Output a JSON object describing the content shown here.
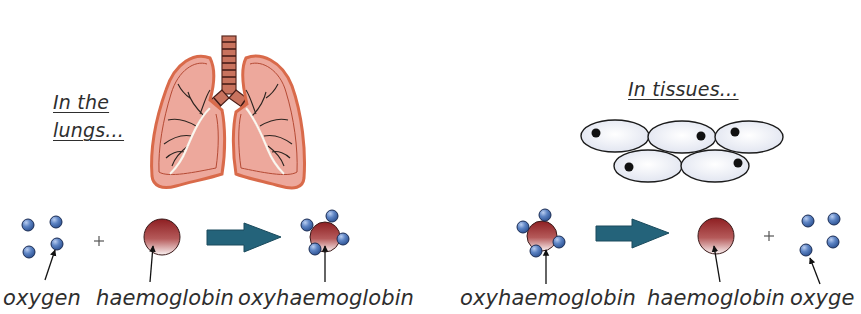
{
  "heading_partial": "…g  h    oxygen, h      oxyg        ",
  "scenes": {
    "lungs": {
      "caption_line1": "In the",
      "caption_line2": "lungs...",
      "equation": {
        "reactant1": "oxygen",
        "plus": "+",
        "reactant2": "haemoglobin",
        "product": "oxyhaemoglobin"
      }
    },
    "tissues": {
      "caption": "In tissues...",
      "cell_count": 5,
      "equation": {
        "reactant": "oxyhaemoglobin",
        "product1": "haemoglobin",
        "plus": "+",
        "product2": "oxyge"
      }
    }
  },
  "icons": {
    "lungs": "lungs-illustration",
    "cells": "tissue-cells-illustration",
    "oxygen": "oxygen-molecule-icon",
    "haemoglobin": "haemoglobin-molecule-icon",
    "reaction_arrow": "reaction-arrow-icon",
    "pointer": "pointer-arrow-icon"
  },
  "colors": {
    "text": "#2e2e2e",
    "lung_fill": "#eda89c",
    "lung_outline": "#e2785a",
    "oxygen_blue": "#4a72b5",
    "haemoglobin_red": "#9b2a2a",
    "arrow_teal": "#24637a",
    "cell_fill": "#eef0f8"
  }
}
